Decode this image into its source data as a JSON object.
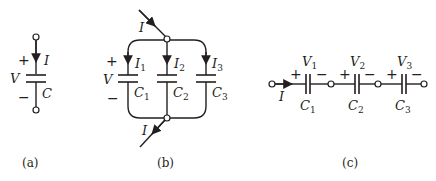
{
  "figure": {
    "panels": [
      {
        "id": "a",
        "caption": "(a)",
        "description": "Single capacitor",
        "labels": {
          "plus": "+",
          "minus": "−",
          "voltage": "V",
          "current": "I",
          "capacitor": "C"
        }
      },
      {
        "id": "b",
        "caption": "(b)",
        "description": "Three capacitors in parallel",
        "labels": {
          "plus": "+",
          "minus": "−",
          "voltage": "V",
          "current_in": "I",
          "current_out": "I",
          "branches": [
            {
              "current": "I",
              "current_sub": "1",
              "capacitor": "C",
              "capacitor_sub": "1"
            },
            {
              "current": "I",
              "current_sub": "2",
              "capacitor": "C",
              "capacitor_sub": "2"
            },
            {
              "current": "I",
              "current_sub": "3",
              "capacitor": "C",
              "capacitor_sub": "3"
            }
          ]
        }
      },
      {
        "id": "c",
        "caption": "(c)",
        "description": "Three capacitors in series",
        "labels": {
          "current": "I",
          "elements": [
            {
              "voltage": "V",
              "voltage_sub": "1",
              "plus": "+",
              "minus": "−",
              "capacitor": "C",
              "capacitor_sub": "1"
            },
            {
              "voltage": "V",
              "voltage_sub": "2",
              "plus": "+",
              "minus": "−",
              "capacitor": "C",
              "capacitor_sub": "2"
            },
            {
              "voltage": "V",
              "voltage_sub": "3",
              "plus": "+",
              "minus": "−",
              "capacitor": "C",
              "capacitor_sub": "3"
            }
          ]
        }
      }
    ]
  },
  "colors": {
    "ink": "#231f20",
    "background": "#ffffff"
  }
}
